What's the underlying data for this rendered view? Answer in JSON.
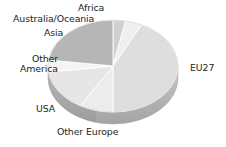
{
  "chart_data": {
    "type": "pie",
    "title": "",
    "subtitle": "",
    "xlabel": "",
    "ylabel": "",
    "grid": false,
    "legend_position": "none",
    "label_style": "outside-callout",
    "three_d": true,
    "categories": [
      "EU27",
      "Other Europe",
      "USA",
      "Other America",
      "Asia",
      "Australia/Oceania",
      "Africa"
    ],
    "values": [
      41,
      8,
      14,
      4,
      22,
      4,
      3
    ],
    "units": "percent",
    "series": [
      {
        "name": "Share",
        "values": [
          41,
          8,
          14,
          4,
          22,
          4,
          3
        ]
      }
    ],
    "slices": [
      {
        "label": "EU27",
        "value": 41,
        "color": "#dedede",
        "side_color": "#b9b9b9"
      },
      {
        "label": "Other Europe",
        "value": 8,
        "color": "#ececec",
        "side_color": "#c4c4c4"
      },
      {
        "label": "USA",
        "value": 14,
        "color": "#e6e6e6",
        "side_color": "#bfbfbf"
      },
      {
        "label": "Other America",
        "value": 4,
        "color": "#f4f4f4",
        "side_color": "#cdcdcd"
      },
      {
        "label": "Asia",
        "value": 22,
        "color": "#b6b6b6",
        "side_color": "#9a9a9a"
      },
      {
        "label": "Australia/Oceania",
        "value": 4,
        "color": "#efefef",
        "side_color": "#c8c8c8"
      },
      {
        "label": "Africa",
        "value": 3,
        "color": "#d0d0d0",
        "side_color": "#adadad"
      }
    ]
  },
  "labels": {
    "africa": "Africa",
    "australia_oceania": "Australia/Oceania",
    "asia": "Asia",
    "other_america_line1": "Other",
    "other_america_line2": "America",
    "usa": "USA",
    "other_europe": "Other Europe",
    "eu27": "EU27"
  },
  "colors": {
    "background": "#ffffff",
    "text": "#231f20",
    "slice_outline": "#ffffff",
    "pie_side": "#b5b5b5",
    "pie_side_shadow": "#a2a2a2"
  }
}
